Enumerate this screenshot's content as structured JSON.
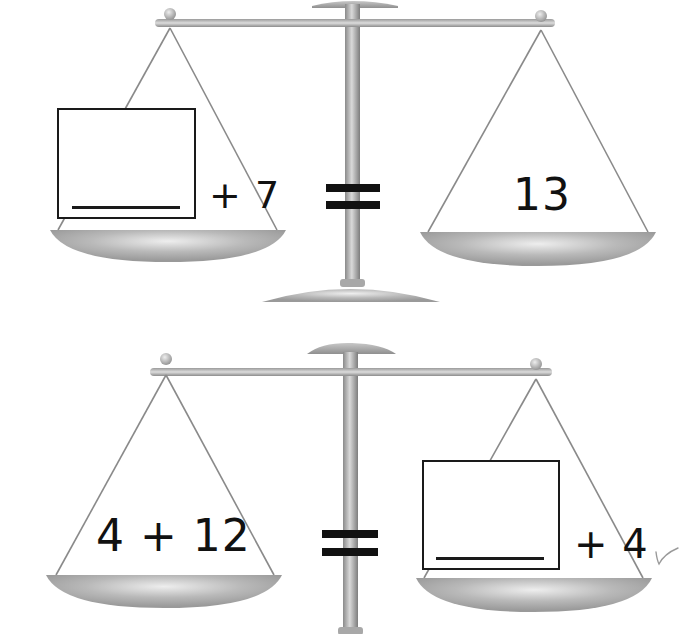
{
  "worksheet": {
    "type": "balance-scale number sentences",
    "colors": {
      "ink": "#111111",
      "metal_dark": "#8e8e8e",
      "metal_mid": "#b4b4b4",
      "metal_light": "#e6e6e6",
      "string": "#8a8a8a",
      "pencil_mark": "#9a9a9a"
    },
    "problems": [
      {
        "left_pan": {
          "answer_box": "",
          "operator": "+",
          "addend": "7",
          "expression_text": "+ 7"
        },
        "equals_sign": "=",
        "right_pan": {
          "value": "13"
        }
      },
      {
        "left_pan": {
          "expression_text": "4 + 12"
        },
        "equals_sign": "=",
        "right_pan": {
          "answer_box": "",
          "operator": "+",
          "addend": "4",
          "expression_text": "+ 4",
          "pencil_check_mark": "✓"
        }
      }
    ]
  }
}
